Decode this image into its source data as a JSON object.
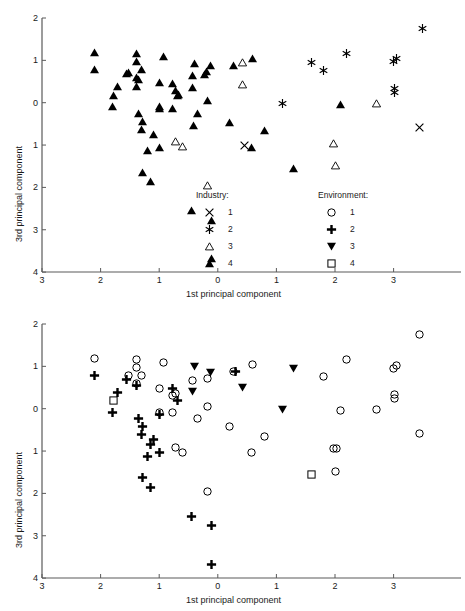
{
  "figure": {
    "panels": [
      "top",
      "bottom"
    ]
  },
  "chart_data": [
    {
      "type": "scatter",
      "panel": "top",
      "title": "",
      "xlabel": "1st principal component",
      "ylabel": "3rd principal component",
      "xlim": [
        -3,
        3.8
      ],
      "ylim": [
        -4,
        2
      ],
      "grid": false,
      "xticks": [
        -3,
        -2,
        -1,
        0,
        1,
        2,
        3
      ],
      "xtick_labels": [
        "3",
        "2",
        "1",
        "0",
        "1",
        "2",
        "3"
      ],
      "yticks": [
        2,
        1,
        0,
        -1,
        -2,
        -3,
        -4
      ],
      "ytick_labels": [
        "2",
        "1",
        "0",
        "1",
        "2",
        "3",
        "4"
      ],
      "legend_position": "inside-lower-right",
      "legend_title": "Industry:",
      "legend": [
        {
          "label": "1",
          "marker": "cross-x"
        },
        {
          "label": "2",
          "marker": "asterisk"
        },
        {
          "label": "3",
          "marker": "triangle-up-open"
        },
        {
          "label": "4",
          "marker": "triangle-up-filled"
        }
      ],
      "series": [
        {
          "name": "1",
          "marker": "cross-x",
          "points": [
            [
              0.45,
              -1.02
            ],
            [
              3.45,
              -0.58
            ]
          ]
        },
        {
          "name": "2",
          "marker": "asterisk",
          "points": [
            [
              3.5,
              1.75
            ],
            [
              2.2,
              1.15
            ],
            [
              3.05,
              1.05
            ],
            [
              3.0,
              0.97
            ],
            [
              1.6,
              0.95
            ],
            [
              1.8,
              0.75
            ],
            [
              3.02,
              0.33
            ],
            [
              3.02,
              0.24
            ],
            [
              1.1,
              -0.02
            ]
          ]
        },
        {
          "name": "3",
          "marker": "triangle-up-open",
          "points": [
            [
              0.42,
              0.95
            ],
            [
              0.43,
              0.43
            ],
            [
              2.7,
              -0.03
            ],
            [
              -0.72,
              -0.92
            ],
            [
              -0.6,
              -1.03
            ],
            [
              1.97,
              -0.97
            ],
            [
              2.0,
              -1.48
            ],
            [
              -0.18,
              -1.95
            ]
          ]
        },
        {
          "name": "4",
          "marker": "triangle-up-filled",
          "points": [
            [
              -2.1,
              1.18
            ],
            [
              -1.38,
              1.15
            ],
            [
              -0.93,
              1.08
            ],
            [
              -1.38,
              0.97
            ],
            [
              -0.4,
              0.93
            ],
            [
              0.6,
              1.05
            ],
            [
              0.27,
              0.88
            ],
            [
              -0.12,
              0.87
            ],
            [
              -2.1,
              0.78
            ],
            [
              -1.3,
              0.78
            ],
            [
              -1.52,
              0.72
            ],
            [
              -1.55,
              0.68
            ],
            [
              -0.43,
              0.65
            ],
            [
              -0.22,
              0.67
            ],
            [
              -0.2,
              0.73
            ],
            [
              -1.38,
              0.6
            ],
            [
              -1.35,
              0.55
            ],
            [
              -1.0,
              0.47
            ],
            [
              -0.78,
              0.45
            ],
            [
              -1.72,
              0.38
            ],
            [
              -1.38,
              0.38
            ],
            [
              -0.43,
              0.35
            ],
            [
              -0.73,
              0.28
            ],
            [
              -0.67,
              0.2
            ],
            [
              -0.68,
              0.17
            ],
            [
              -1.78,
              0.17
            ],
            [
              -1.8,
              -0.1
            ],
            [
              -1.0,
              -0.08
            ],
            [
              -1.0,
              -0.13
            ],
            [
              -0.77,
              -0.13
            ],
            [
              -0.18,
              0.06
            ],
            [
              2.1,
              -0.05
            ],
            [
              -1.35,
              -0.25
            ],
            [
              -0.35,
              -0.25
            ],
            [
              -1.28,
              -0.45
            ],
            [
              -1.3,
              -0.63
            ],
            [
              -0.42,
              -0.55
            ],
            [
              0.2,
              -0.46
            ],
            [
              -1.1,
              -0.75
            ],
            [
              0.8,
              -0.65
            ],
            [
              -1.0,
              -1.05
            ],
            [
              -1.2,
              -1.12
            ],
            [
              0.58,
              -1.05
            ],
            [
              -1.28,
              -1.65
            ],
            [
              -1.15,
              -1.85
            ],
            [
              1.3,
              -1.55
            ],
            [
              -0.45,
              -2.55
            ],
            [
              -0.1,
              -2.77
            ],
            [
              -0.1,
              -3.68
            ]
          ]
        }
      ]
    },
    {
      "type": "scatter",
      "panel": "bottom",
      "title": "",
      "xlabel": "1st principal component",
      "ylabel": "3rd principal component",
      "xlim": [
        -3,
        3.8
      ],
      "ylim": [
        -4,
        2
      ],
      "grid": false,
      "xticks": [
        -3,
        -2,
        -1,
        0,
        1,
        2,
        3
      ],
      "xtick_labels": [
        "3",
        "2",
        "1",
        "0",
        "1",
        "2",
        "3"
      ],
      "yticks": [
        2,
        1,
        0,
        -1,
        -2,
        -3,
        -4
      ],
      "ytick_labels": [
        "2",
        "1",
        "0",
        "1",
        "2",
        "3",
        "4"
      ],
      "legend_position": "none",
      "legend_title": "Environment:",
      "legend": [
        {
          "label": "1",
          "marker": "circle-open"
        },
        {
          "label": "2",
          "marker": "plus-filled"
        },
        {
          "label": "3",
          "marker": "triangle-down-filled"
        },
        {
          "label": "4",
          "marker": "square-open"
        }
      ],
      "series": [
        {
          "name": "1",
          "marker": "circle-open",
          "points": [
            [
              3.45,
              1.75
            ],
            [
              -2.1,
              1.18
            ],
            [
              -1.38,
              1.15
            ],
            [
              2.2,
              1.15
            ],
            [
              -0.93,
              1.08
            ],
            [
              0.6,
              1.05
            ],
            [
              -1.38,
              0.97
            ],
            [
              3.05,
              1.02
            ],
            [
              3.0,
              0.95
            ],
            [
              0.27,
              0.88
            ],
            [
              1.8,
              0.75
            ],
            [
              -1.3,
              0.78
            ],
            [
              -1.52,
              0.78
            ],
            [
              -0.43,
              0.67
            ],
            [
              -0.18,
              0.72
            ],
            [
              -1.38,
              0.6
            ],
            [
              -1.0,
              0.47
            ],
            [
              3.02,
              0.33
            ],
            [
              3.02,
              0.24
            ],
            [
              -0.78,
              0.3
            ],
            [
              -0.73,
              0.35
            ],
            [
              -0.18,
              0.06
            ],
            [
              -1.0,
              -0.08
            ],
            [
              -0.77,
              -0.1
            ],
            [
              2.1,
              -0.05
            ],
            [
              2.7,
              -0.03
            ],
            [
              -0.35,
              -0.22
            ],
            [
              0.2,
              -0.43
            ],
            [
              0.8,
              -0.65
            ],
            [
              3.45,
              -0.58
            ],
            [
              -0.72,
              -0.92
            ],
            [
              -0.6,
              -1.03
            ],
            [
              0.58,
              -1.03
            ],
            [
              1.97,
              -0.95
            ],
            [
              2.02,
              -0.95
            ],
            [
              2.0,
              -1.48
            ],
            [
              -0.18,
              -1.95
            ]
          ]
        },
        {
          "name": "2",
          "marker": "plus-filled",
          "points": [
            [
              -2.1,
              0.78
            ],
            [
              -1.55,
              0.68
            ],
            [
              -1.38,
              0.55
            ],
            [
              -0.78,
              0.48
            ],
            [
              -0.68,
              0.2
            ],
            [
              0.3,
              0.88
            ],
            [
              -1.72,
              0.38
            ],
            [
              -1.8,
              -0.1
            ],
            [
              -1.35,
              -0.22
            ],
            [
              -1.0,
              -0.13
            ],
            [
              -1.28,
              -0.42
            ],
            [
              -1.3,
              -0.62
            ],
            [
              -1.1,
              -0.73
            ],
            [
              -1.15,
              -0.85
            ],
            [
              -1.2,
              -1.12
            ],
            [
              -1.0,
              -1.03
            ],
            [
              -1.28,
              -1.63
            ],
            [
              -1.15,
              -1.85
            ],
            [
              -0.45,
              -2.55
            ],
            [
              -0.1,
              -2.75
            ],
            [
              -0.1,
              -3.68
            ]
          ]
        },
        {
          "name": "3",
          "marker": "triangle-down-filled",
          "points": [
            [
              -0.4,
              1.0
            ],
            [
              -0.12,
              0.85
            ],
            [
              1.3,
              0.95
            ],
            [
              -0.43,
              0.4
            ],
            [
              0.42,
              0.5
            ],
            [
              1.1,
              -0.02
            ]
          ]
        },
        {
          "name": "4",
          "marker": "square-open",
          "points": [
            [
              -1.78,
              0.2
            ],
            [
              1.6,
              -1.55
            ]
          ]
        }
      ]
    }
  ]
}
